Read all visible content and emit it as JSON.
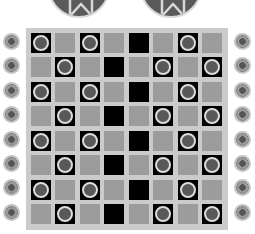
{
  "board": {
    "rows": 8,
    "cols": 8,
    "colors": {
      "board_bg": "#cbcbcb",
      "gray_cell": "#9c9c9c",
      "black_cell": "#000000",
      "piece_fill": "#585858",
      "piece_ring": "#dcdcdc"
    },
    "grid": [
      [
        "piece",
        "gray",
        "piece",
        "gray",
        "black",
        "gray",
        "piece",
        "gray"
      ],
      [
        "gray",
        "piece",
        "gray",
        "black",
        "gray",
        "piece",
        "gray",
        "piece"
      ],
      [
        "piece",
        "gray",
        "piece",
        "gray",
        "black",
        "gray",
        "piece",
        "gray"
      ],
      [
        "gray",
        "piece",
        "gray",
        "black",
        "gray",
        "piece",
        "gray",
        "piece"
      ],
      [
        "piece",
        "gray",
        "piece",
        "gray",
        "black",
        "gray",
        "piece",
        "gray"
      ],
      [
        "gray",
        "piece",
        "gray",
        "black",
        "gray",
        "piece",
        "gray",
        "piece"
      ],
      [
        "piece",
        "gray",
        "piece",
        "gray",
        "black",
        "gray",
        "piece",
        "gray"
      ],
      [
        "gray",
        "piece",
        "gray",
        "black",
        "gray",
        "piece",
        "gray",
        "piece"
      ]
    ]
  },
  "top_tokens": [
    {
      "icon": "ribbon-badge-icon"
    },
    {
      "icon": "ribbon-badge-icon"
    }
  ],
  "side_ornaments": {
    "left_count": 8,
    "right_count": 8,
    "icon": "flower-ornament-icon"
  }
}
